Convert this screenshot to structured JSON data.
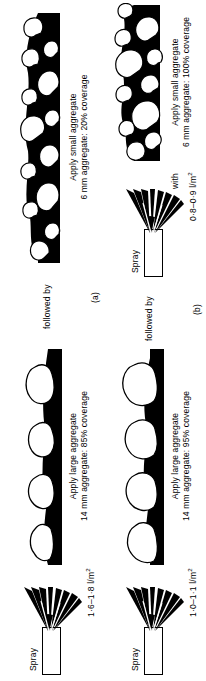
{
  "figure": {
    "panels": [
      {
        "tag": "(a)",
        "steps": [
          {
            "kind": "spray",
            "label": "Spray",
            "rate": "1·6–1·8 l/m",
            "rate_unit_sup": "2"
          },
          {
            "kind": "aggregate",
            "caption_line1": "Apply large aggregate",
            "caption_line2": "14 mm aggregate: 85% coverage",
            "aggregate_size": "14 mm",
            "coverage": "85%"
          },
          {
            "kind": "connector",
            "label": "followed by"
          },
          {
            "kind": "aggregate",
            "caption_line1": "Apply small aggregate",
            "caption_line2": "6 mm aggregate: 20% coverage",
            "aggregate_size": "6 mm",
            "coverage": "20%"
          }
        ]
      },
      {
        "tag": "(b)",
        "steps": [
          {
            "kind": "spray",
            "label": "Spray",
            "rate": "1·0–1·1 l/m",
            "rate_unit_sup": "2"
          },
          {
            "kind": "aggregate",
            "caption_line1": "Apply large aggregate",
            "caption_line2": "14 mm aggregate: 95% coverage",
            "aggregate_size": "14 mm",
            "coverage": "95%"
          },
          {
            "kind": "connector",
            "label": "followed by"
          },
          {
            "kind": "spray",
            "label": "Spray",
            "rate": "0·8–0·9 l/m",
            "rate_unit_sup": "2"
          },
          {
            "kind": "connector",
            "label": "with"
          },
          {
            "kind": "aggregate",
            "caption_line1": "Apply small aggregate",
            "caption_line2": "6 mm aggregate: 100% coverage",
            "aggregate_size": "6 mm",
            "coverage": "100%"
          }
        ]
      }
    ],
    "colors": {
      "binder": "#000000",
      "aggregate_fill": "#ffffff",
      "outline": "#000000",
      "background": "#ffffff"
    }
  }
}
